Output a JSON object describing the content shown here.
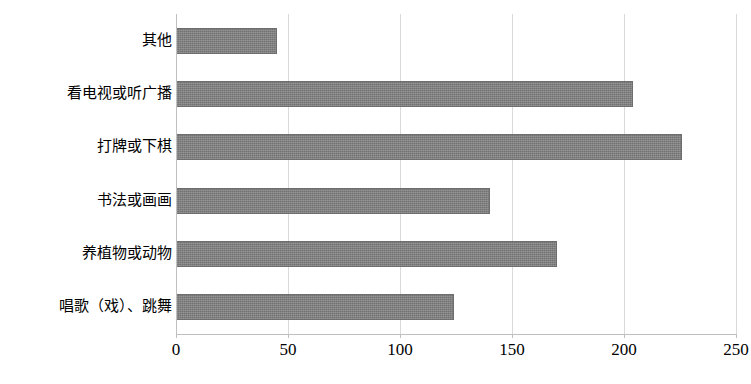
{
  "chart_data": {
    "type": "bar",
    "orientation": "horizontal",
    "title": "",
    "xlabel": "",
    "ylabel": "",
    "categories": [
      "唱歌（戏）、跳舞",
      "养植物或动物",
      "书法或画画",
      "打牌或下棋",
      "看电视或听广播",
      "其他"
    ],
    "values": [
      124,
      170,
      140,
      226,
      204,
      45
    ],
    "xlim": [
      0,
      250
    ],
    "xticks": [
      0,
      50,
      100,
      150,
      200,
      250
    ],
    "xtick_labels": [
      "0",
      "50",
      "100",
      "150",
      "200",
      "250"
    ],
    "grid": true,
    "legend": false,
    "bar_color": "#7f7f7f",
    "gridline_color": "#d9d9d9",
    "axis_color": "#bfbfbf",
    "background_color": "#ffffff"
  }
}
